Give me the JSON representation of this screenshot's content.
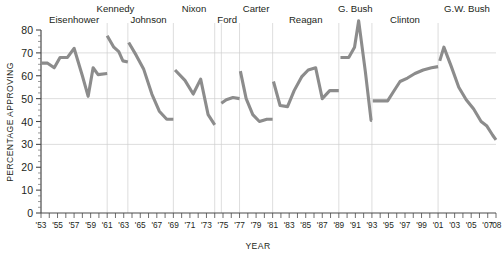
{
  "chart_data": {
    "type": "line",
    "title": "",
    "xlabel": "YEAR",
    "ylabel": "PERCENTAGE APPROVING",
    "ylim": [
      0,
      80
    ],
    "ytick_step": 10,
    "yticks": [
      "0",
      "10",
      "20",
      "30",
      "40",
      "50",
      "60",
      "70",
      "80"
    ],
    "xlim": [
      1953,
      2008
    ],
    "grid": "horizontal-gridlines-at-30-50-70-plus-president-dividers",
    "legend": "none",
    "line_color": "#8c8c8c",
    "xticks": [
      "'53",
      "'55",
      "'57",
      "'59",
      "'61",
      "'63",
      "'65",
      "'67",
      "'69",
      "'71",
      "'73",
      "'75",
      "'77",
      "'79",
      "'81",
      "'83",
      "'85",
      "'87",
      "'89",
      "'91",
      "'93",
      "'95",
      "'97",
      "'99",
      "'01",
      "'03",
      "'05",
      "'07",
      "'08"
    ],
    "minor_tick_years_every": 1,
    "president_labels": [
      {
        "name": "Eisenhower",
        "start_year": 1953,
        "end_year": 1961
      },
      {
        "name": "Kennedy",
        "start_year": 1961,
        "end_year": 1963
      },
      {
        "name": "Johnson",
        "start_year": 1963,
        "end_year": 1969
      },
      {
        "name": "Nixon",
        "start_year": 1969,
        "end_year": 1974
      },
      {
        "name": "Ford",
        "start_year": 1974,
        "end_year": 1977
      },
      {
        "name": "Carter",
        "start_year": 1977,
        "end_year": 1981
      },
      {
        "name": "Reagan",
        "start_year": 1981,
        "end_year": 1989
      },
      {
        "name": "G. Bush",
        "start_year": 1989,
        "end_year": 1993
      },
      {
        "name": "Clinton",
        "start_year": 1993,
        "end_year": 2001
      },
      {
        "name": "G.W. Bush",
        "start_year": 2001,
        "end_year": 2008
      }
    ],
    "divider_years": [
      1961,
      1963.5,
      1969,
      1974,
      1974.8,
      1977,
      1981,
      1989,
      1993,
      2001
    ],
    "series": [
      {
        "name": "Presidential approval",
        "segments": [
          {
            "president": "Eisenhower",
            "points": [
              [
                1953.0,
                65.5
              ],
              [
                1953.8,
                65.5
              ],
              [
                1954.6,
                63.5
              ],
              [
                1955.3,
                68.0
              ],
              [
                1956.2,
                68.0
              ],
              [
                1957.0,
                72.0
              ],
              [
                1958.0,
                60.0
              ],
              [
                1958.7,
                51.0
              ],
              [
                1959.3,
                63.5
              ],
              [
                1959.9,
                60.5
              ],
              [
                1961.0,
                61.0
              ]
            ]
          },
          {
            "president": "Kennedy",
            "points": [
              [
                1961.0,
                77.5
              ],
              [
                1961.8,
                72.5
              ],
              [
                1962.4,
                70.5
              ],
              [
                1962.9,
                66.5
              ],
              [
                1963.5,
                66.0
              ]
            ]
          },
          {
            "president": "Johnson",
            "points": [
              [
                1963.6,
                74.5
              ],
              [
                1964.5,
                69.0
              ],
              [
                1965.4,
                63.0
              ],
              [
                1966.4,
                52.0
              ],
              [
                1967.3,
                44.5
              ],
              [
                1968.2,
                41.0
              ],
              [
                1969.0,
                41.0
              ]
            ]
          },
          {
            "president": "Nixon",
            "points": [
              [
                1969.2,
                62.5
              ],
              [
                1970.4,
                58.0
              ],
              [
                1971.4,
                52.0
              ],
              [
                1972.3,
                58.5
              ],
              [
                1973.2,
                43.0
              ],
              [
                1974.0,
                38.5
              ]
            ]
          },
          {
            "president": "Ford",
            "points": [
              [
                1974.8,
                48.0
              ],
              [
                1975.4,
                49.5
              ],
              [
                1976.2,
                50.5
              ],
              [
                1977.0,
                50.0
              ]
            ]
          },
          {
            "president": "Carter",
            "points": [
              [
                1977.1,
                62.0
              ],
              [
                1977.8,
                50.0
              ],
              [
                1978.6,
                43.0
              ],
              [
                1979.4,
                40.0
              ],
              [
                1980.3,
                41.0
              ],
              [
                1981.0,
                41.0
              ]
            ]
          },
          {
            "president": "Reagan",
            "points": [
              [
                1981.1,
                57.5
              ],
              [
                1981.9,
                47.0
              ],
              [
                1982.8,
                46.5
              ],
              [
                1983.6,
                53.5
              ],
              [
                1984.5,
                59.5
              ],
              [
                1985.3,
                62.5
              ],
              [
                1986.2,
                63.5
              ],
              [
                1987.0,
                50.0
              ],
              [
                1987.9,
                53.5
              ],
              [
                1988.6,
                53.5
              ],
              [
                1989.0,
                53.5
              ]
            ]
          },
          {
            "president": "G. Bush",
            "points": [
              [
                1989.2,
                68.0
              ],
              [
                1990.2,
                68.0
              ],
              [
                1990.9,
                72.5
              ],
              [
                1991.4,
                84.0
              ],
              [
                1992.2,
                62.0
              ],
              [
                1992.9,
                40.5
              ],
              [
                1993.0,
                40.5
              ]
            ]
          },
          {
            "president": "Clinton",
            "points": [
              [
                1993.1,
                49.0
              ],
              [
                1994.0,
                49.0
              ],
              [
                1994.9,
                49.0
              ],
              [
                1995.6,
                53.0
              ],
              [
                1996.4,
                57.5
              ],
              [
                1997.3,
                59.0
              ],
              [
                1998.2,
                61.0
              ],
              [
                1999.2,
                62.5
              ],
              [
                2000.2,
                63.5
              ],
              [
                2001.0,
                64.0
              ]
            ]
          },
          {
            "president": "G.W. Bush",
            "points": [
              [
                2001.2,
                66.5
              ],
              [
                2001.7,
                72.5
              ],
              [
                2002.6,
                64.0
              ],
              [
                2003.5,
                55.0
              ],
              [
                2004.4,
                49.5
              ],
              [
                2005.3,
                45.5
              ],
              [
                2006.2,
                40.0
              ],
              [
                2006.9,
                38.0
              ],
              [
                2007.6,
                34.0
              ],
              [
                2008.0,
                32.0
              ]
            ]
          }
        ]
      }
    ],
    "gridline_values": [
      30,
      50,
      70
    ]
  }
}
